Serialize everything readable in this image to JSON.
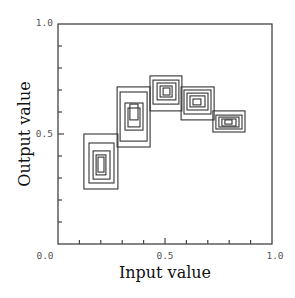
{
  "chart_data": {
    "type": "contour",
    "title": "",
    "xlabel": "Input value",
    "ylabel": "Output value",
    "xlim": [
      0.0,
      1.0
    ],
    "ylim": [
      0.0,
      1.0
    ],
    "x_tick_labels": [
      "0.0",
      "0.5",
      "1.0"
    ],
    "y_tick_labels": [
      "0.0",
      "0.5",
      "1.0"
    ],
    "minor_tick_step": 0.1,
    "grid": false,
    "legend": null,
    "clusters": [
      {
        "name": "cluster-1",
        "center": [
          0.22,
          0.36
        ],
        "rects": [
          [
            0.121,
            0.25,
            0.28,
            0.5
          ],
          [
            0.145,
            0.277,
            0.262,
            0.459
          ],
          [
            0.164,
            0.295,
            0.243,
            0.423
          ],
          [
            0.178,
            0.314,
            0.224,
            0.405
          ],
          [
            0.187,
            0.327,
            0.215,
            0.395
          ]
        ]
      },
      {
        "name": "cluster-2",
        "center": [
          0.4,
          0.62
        ],
        "rects": [
          [
            0.276,
            0.441,
            0.43,
            0.714
          ],
          [
            0.29,
            0.468,
            0.416,
            0.691
          ],
          [
            0.313,
            0.518,
            0.397,
            0.641
          ],
          [
            0.327,
            0.532,
            0.383,
            0.618
          ],
          [
            0.336,
            0.564,
            0.374,
            0.636
          ]
        ]
      },
      {
        "name": "cluster-3",
        "center": [
          0.52,
          0.71
        ],
        "rects": [
          [
            0.43,
            0.605,
            0.579,
            0.764
          ],
          [
            0.444,
            0.636,
            0.565,
            0.745
          ],
          [
            0.463,
            0.655,
            0.551,
            0.732
          ],
          [
            0.477,
            0.668,
            0.533,
            0.718
          ],
          [
            0.491,
            0.677,
            0.523,
            0.709
          ]
        ]
      },
      {
        "name": "cluster-4",
        "center": [
          0.66,
          0.66
        ],
        "rects": [
          [
            0.575,
            0.564,
            0.729,
            0.714
          ],
          [
            0.589,
            0.591,
            0.715,
            0.7
          ],
          [
            0.603,
            0.609,
            0.701,
            0.686
          ],
          [
            0.617,
            0.623,
            0.687,
            0.673
          ],
          [
            0.631,
            0.632,
            0.668,
            0.659
          ]
        ]
      },
      {
        "name": "cluster-5",
        "center": [
          0.8,
          0.55
        ],
        "rects": [
          [
            0.724,
            0.509,
            0.874,
            0.605
          ],
          [
            0.738,
            0.523,
            0.86,
            0.586
          ],
          [
            0.752,
            0.532,
            0.846,
            0.577
          ],
          [
            0.766,
            0.536,
            0.832,
            0.568
          ],
          [
            0.78,
            0.545,
            0.813,
            0.564
          ]
        ]
      }
    ]
  },
  "axes": {
    "x_title": "Input value",
    "y_title": "Output value",
    "x_labels": {
      "min": "0.0",
      "mid": "0.5",
      "max": "1.0"
    },
    "y_labels": {
      "min": "0.0",
      "mid": "0.5",
      "max": "1.0"
    }
  }
}
